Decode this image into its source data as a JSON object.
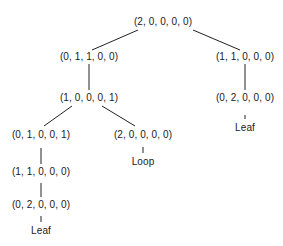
{
  "diagram": {
    "type": "tree",
    "nodes": {
      "root": {
        "label": "(2, 0, 0, 0, 0)",
        "x": 163,
        "y": 22
      },
      "n_01100": {
        "label": "(0, 1, 1, 0, 0)",
        "x": 89,
        "y": 57
      },
      "n_11000_r": {
        "label": "(1, 1, 0, 0, 0)",
        "x": 245,
        "y": 57
      },
      "n_10001": {
        "label": "(1, 0, 0, 0, 1)",
        "x": 89,
        "y": 98
      },
      "n_02000_r": {
        "label": "(0, 2, 0, 0, 0)",
        "x": 245,
        "y": 98
      },
      "leaf_r": {
        "label": "Leaf",
        "x": 245,
        "y": 128
      },
      "n_01001": {
        "label": "(0, 1, 0, 0, 1)",
        "x": 41,
        "y": 135
      },
      "n_20000": {
        "label": "(2, 0, 0, 0, 0)",
        "x": 143,
        "y": 135
      },
      "loop": {
        "label": "Loop",
        "x": 143,
        "y": 162
      },
      "n_11000_l": {
        "label": "(1, 1, 0, 0, 0)",
        "x": 41,
        "y": 172
      },
      "n_02000_l": {
        "label": "(0, 2, 0, 0, 0)",
        "x": 41,
        "y": 205
      },
      "leaf_l": {
        "label": "Leaf",
        "x": 41,
        "y": 231
      }
    },
    "edges": [
      {
        "from": "root",
        "to": "n_01100"
      },
      {
        "from": "root",
        "to": "n_11000_r"
      },
      {
        "from": "n_01100",
        "to": "n_10001"
      },
      {
        "from": "n_11000_r",
        "to": "n_02000_r"
      },
      {
        "from": "n_02000_r",
        "to": "leaf_r"
      },
      {
        "from": "n_10001",
        "to": "n_01001"
      },
      {
        "from": "n_10001",
        "to": "n_20000"
      },
      {
        "from": "n_20000",
        "to": "loop"
      },
      {
        "from": "n_01001",
        "to": "n_11000_l"
      },
      {
        "from": "n_11000_l",
        "to": "n_02000_l"
      },
      {
        "from": "n_02000_l",
        "to": "leaf_l"
      }
    ]
  }
}
